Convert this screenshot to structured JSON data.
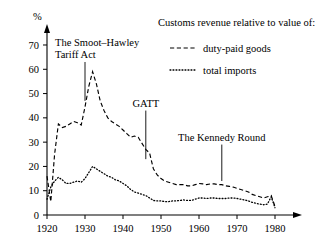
{
  "chart_data": {
    "type": "line",
    "title": "",
    "subtitle": "",
    "xlabel": "",
    "ylabel": "%",
    "ylim": [
      0,
      75
    ],
    "xlim": [
      1920,
      1983
    ],
    "grid": false,
    "legend_position": "top-right",
    "legend_title": "Customs revenue relative to value of:",
    "y_ticks": [
      0,
      10,
      20,
      30,
      40,
      50,
      60,
      70
    ],
    "y_tick_labels": [
      "0",
      "10",
      "20",
      "30",
      "40",
      "50",
      "60",
      "70"
    ],
    "x_ticks": [
      1920,
      1930,
      1940,
      1950,
      1960,
      1970,
      1980
    ],
    "x_tick_labels": [
      "1920",
      "1930",
      "1940",
      "1950",
      "1960",
      "1970",
      "1980"
    ],
    "series": [
      {
        "name": "duty-paid goods",
        "style": "dashed",
        "color": "#000000",
        "x": [
          1920,
          1921,
          1922,
          1923,
          1924,
          1925,
          1926,
          1927,
          1928,
          1929,
          1930,
          1931,
          1932,
          1933,
          1934,
          1935,
          1936,
          1937,
          1938,
          1939,
          1940,
          1941,
          1942,
          1943,
          1944,
          1945,
          1946,
          1947,
          1948,
          1949,
          1950,
          1951,
          1952,
          1953,
          1954,
          1955,
          1956,
          1957,
          1958,
          1959,
          1960,
          1961,
          1962,
          1963,
          1964,
          1965,
          1966,
          1967,
          1968,
          1969,
          1970,
          1971,
          1972,
          1973,
          1974,
          1975,
          1976,
          1977,
          1978,
          1979,
          1980
        ],
        "y": [
          16.0,
          5.5,
          25.0,
          37.5,
          36.0,
          36.5,
          37.5,
          38.5,
          38.0,
          37.0,
          44.5,
          53.0,
          59.0,
          54.0,
          47.0,
          43.0,
          40.0,
          38.5,
          37.5,
          36.5,
          35.0,
          33.5,
          32.0,
          32.5,
          32.0,
          29.5,
          27.0,
          25.5,
          19.0,
          16.5,
          15.0,
          14.0,
          13.5,
          13.0,
          12.5,
          12.5,
          12.5,
          12.0,
          12.0,
          12.5,
          13.0,
          12.8,
          12.5,
          12.8,
          12.8,
          12.5,
          12.5,
          12.0,
          11.8,
          11.5,
          11.0,
          10.5,
          10.0,
          9.5,
          8.5,
          8.0,
          7.5,
          7.0,
          7.5,
          8.0,
          3.5
        ]
      },
      {
        "name": "total imports",
        "style": "dotted",
        "color": "#000000",
        "x": [
          1920,
          1921,
          1922,
          1923,
          1924,
          1925,
          1926,
          1927,
          1928,
          1929,
          1930,
          1931,
          1932,
          1933,
          1934,
          1935,
          1936,
          1937,
          1938,
          1939,
          1940,
          1941,
          1942,
          1943,
          1944,
          1945,
          1946,
          1947,
          1948,
          1949,
          1950,
          1951,
          1952,
          1953,
          1954,
          1955,
          1956,
          1957,
          1958,
          1959,
          1960,
          1961,
          1962,
          1963,
          1964,
          1965,
          1966,
          1967,
          1968,
          1969,
          1970,
          1971,
          1972,
          1973,
          1974,
          1975,
          1976,
          1977,
          1978,
          1979,
          1980
        ],
        "y": [
          6.5,
          11.5,
          14.0,
          15.5,
          14.5,
          13.0,
          13.0,
          13.5,
          14.0,
          13.5,
          15.0,
          17.5,
          20.0,
          19.0,
          18.0,
          17.0,
          16.0,
          15.5,
          14.5,
          14.0,
          13.0,
          12.0,
          10.5,
          9.5,
          9.0,
          8.5,
          8.0,
          7.0,
          6.0,
          5.8,
          5.8,
          5.5,
          5.5,
          5.8,
          5.8,
          6.0,
          6.2,
          6.0,
          6.0,
          6.5,
          7.0,
          7.0,
          6.8,
          7.0,
          7.0,
          6.8,
          6.8,
          6.8,
          7.0,
          7.0,
          6.8,
          6.5,
          6.2,
          5.8,
          5.2,
          4.8,
          4.5,
          4.2,
          4.5,
          7.5,
          3.0
        ]
      }
    ],
    "annotations": [
      {
        "label_line1": "The Smoot–Hawley",
        "label_line2": "Tariff Act",
        "x": 1930,
        "y_top": 63,
        "y_bottom": 47
      },
      {
        "label_line1": "GATT",
        "label_line2": "",
        "x": 1946,
        "y_top": 43,
        "y_bottom": 23
      },
      {
        "label_line1": "The Kennedy Round",
        "label_line2": "",
        "x": 1966,
        "y_top": 29,
        "y_bottom": 14
      }
    ]
  },
  "legend": {
    "title": "Customs revenue relative to value of:",
    "entries": [
      {
        "label": "duty-paid goods",
        "style": "dashed"
      },
      {
        "label": "total imports",
        "style": "dotted"
      }
    ]
  },
  "axes": {
    "y_unit_label": "%",
    "y_labels": [
      "70",
      "60",
      "50",
      "40",
      "30",
      "20",
      "10",
      "0"
    ],
    "x_labels": [
      "1920",
      "1930",
      "1940",
      "1950",
      "1960",
      "1970",
      "1980"
    ]
  },
  "annotations_text": {
    "smoot_hawley_l1": "The Smoot–Hawley",
    "smoot_hawley_l2": "Tariff Act",
    "gatt": "GATT",
    "kennedy_round": "The Kennedy Round"
  }
}
